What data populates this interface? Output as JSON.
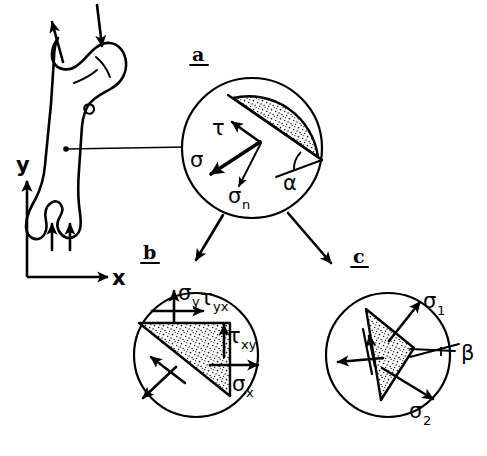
{
  "figure": {
    "background_color": "#ffffff",
    "line_color": "#000000"
  },
  "axes": {
    "x_label": "x",
    "y_label": "y"
  },
  "bone": {
    "name": "femur",
    "load_arrow_head_label": "",
    "load_arrow_trochanter_label": "",
    "support_arrow_1_label": "",
    "support_arrow_2_label": ""
  },
  "panels": [
    {
      "id": "a",
      "letter": "a",
      "center_x": 252,
      "center_y": 148,
      "radius": 70,
      "labels": [
        {
          "key": "tau",
          "text": "τ",
          "sub": "",
          "x": 219,
          "y": 128
        },
        {
          "key": "sigma",
          "text": "σ",
          "sub": "",
          "x": 196,
          "y": 160
        },
        {
          "key": "sigma_n",
          "text": "σ",
          "sub": "n",
          "x": 233,
          "y": 196
        },
        {
          "key": "alpha",
          "text": "α",
          "sub": "",
          "x": 289,
          "y": 182
        }
      ]
    },
    {
      "id": "b",
      "letter": "b",
      "center_x": 196,
      "center_y": 355,
      "radius": 62,
      "labels": [
        {
          "key": "sigma_y",
          "text": "σ",
          "sub": "y",
          "x": 183,
          "y": 295
        },
        {
          "key": "tau_yx",
          "text": "τ",
          "sub": "yx",
          "x": 205,
          "y": 300
        },
        {
          "key": "tau_xy",
          "text": "τ",
          "sub": "xy",
          "x": 230,
          "y": 338
        },
        {
          "key": "sigma_x",
          "text": "σ",
          "sub": "x",
          "x": 241,
          "y": 385
        }
      ]
    },
    {
      "id": "c",
      "letter": "c",
      "center_x": 388,
      "center_y": 355,
      "radius": 62,
      "labels": [
        {
          "key": "sigma_1",
          "text": "σ",
          "sub": "1",
          "x": 414,
          "y": 302
        },
        {
          "key": "beta",
          "text": "β",
          "sub": "",
          "x": 448,
          "y": 352
        },
        {
          "key": "sigma_2",
          "text": "σ",
          "sub": "2",
          "x": 415,
          "y": 414
        }
      ]
    }
  ],
  "symbols": {
    "tau": "τ",
    "sigma": "σ",
    "alpha": "α",
    "beta": "β",
    "subscript_n": "n",
    "subscript_x": "x",
    "subscript_y": "y",
    "subscript_yx": "yx",
    "subscript_xy": "xy",
    "subscript_1": "1",
    "subscript_2": "2"
  }
}
